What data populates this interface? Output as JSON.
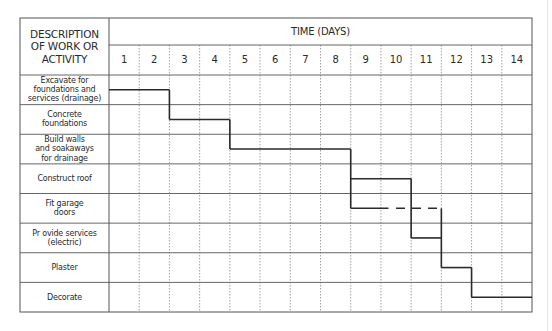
{
  "header": {
    "description_lines": [
      "DESCRIPTION",
      "OF WORK OR",
      "ACTIVITY"
    ],
    "time_label": "TIME (DAYS)"
  },
  "days": [
    "1",
    "2",
    "3",
    "4",
    "5",
    "6",
    "7",
    "8",
    "9",
    "10",
    "11",
    "12",
    "13",
    "14"
  ],
  "activities": [
    {
      "label_lines": [
        "Excavate for",
        "foundations and",
        "services (drainage)"
      ]
    },
    {
      "label_lines": [
        "Concrete",
        "foundations"
      ]
    },
    {
      "label_lines": [
        "Build walls",
        "and soakaways",
        "for drainage"
      ]
    },
    {
      "label_lines": [
        "Construct roof"
      ]
    },
    {
      "label_lines": [
        "Fit garage",
        "doors"
      ]
    },
    {
      "label_lines": [
        "Pr ovide services",
        "(electric)"
      ]
    },
    {
      "label_lines": [
        "Plaster"
      ]
    },
    {
      "label_lines": [
        "Decorate"
      ]
    }
  ],
  "colors": {
    "grid": "#555555",
    "dotted": "#8a8a8a",
    "bar": "#2a2a2a"
  },
  "chart_data": {
    "type": "gantt",
    "title": "TIME (DAYS)",
    "xlabel": "TIME (DAYS)",
    "ylabel": "DESCRIPTION OF WORK OR ACTIVITY",
    "x_ticks": [
      1,
      2,
      3,
      4,
      5,
      6,
      7,
      8,
      9,
      10,
      11,
      12,
      13,
      14
    ],
    "xlim": [
      0,
      14
    ],
    "grid": {
      "vertical": "dotted",
      "horizontal": "solid"
    },
    "tasks": [
      {
        "name": "Excavate for foundations and services (drainage)",
        "start": 0,
        "end": 2,
        "style": "solid"
      },
      {
        "name": "Concrete foundations",
        "start": 2,
        "end": 4,
        "style": "solid"
      },
      {
        "name": "Build walls and soakaways for drainage",
        "start": 4,
        "end": 8,
        "style": "solid"
      },
      {
        "name": "Construct roof",
        "start": 8,
        "end": 10,
        "style": "solid"
      },
      {
        "name": "Fit garage doors",
        "start": 8,
        "end": 11,
        "style": "solid then dashed (float)",
        "solid_end": 9.25
      },
      {
        "name": "Provide services (electric)",
        "start": 10,
        "end": 11,
        "style": "solid"
      },
      {
        "name": "Plaster",
        "start": 11,
        "end": 12,
        "style": "solid"
      },
      {
        "name": "Decorate",
        "start": 12,
        "end": 14,
        "style": "solid"
      }
    ],
    "dependencies": [
      [
        "Excavate",
        "Concrete foundations"
      ],
      [
        "Concrete foundations",
        "Build walls"
      ],
      [
        "Build walls",
        "Construct roof"
      ],
      [
        "Build walls",
        "Fit garage doors"
      ],
      [
        "Construct roof",
        "Provide services"
      ],
      [
        "Fit garage doors",
        "Plaster"
      ],
      [
        "Provide services",
        "Plaster"
      ],
      [
        "Plaster",
        "Decorate"
      ]
    ]
  }
}
